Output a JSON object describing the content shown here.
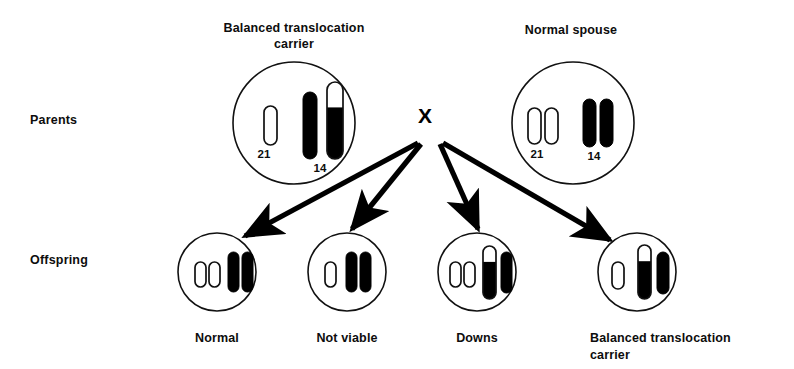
{
  "figure": {
    "row_labels": {
      "parents": "Parents",
      "offspring": "Offspring"
    },
    "cross_symbol": "X",
    "colors": {
      "outline": "#111111",
      "filled_chromosome": "#000000",
      "unfilled_chromosome": "#ffffff",
      "background": "#ffffff"
    }
  },
  "parents": [
    {
      "id": "parent-carrier",
      "caption": "Balanced translocation\ncarrier",
      "circle": {
        "cx": 294,
        "cy": 123,
        "r": 61
      },
      "chromosome_labels": [
        {
          "text": "21",
          "x": 264,
          "y": 158
        },
        {
          "text": "14",
          "x": 320,
          "y": 172
        }
      ],
      "chromosomes": [
        {
          "name": "21-unfilled",
          "x": 264,
          "top": 106,
          "width": 13,
          "height": 39,
          "fill": "none",
          "split": 0
        },
        {
          "name": "14-filled",
          "x": 303,
          "top": 92,
          "width": 14,
          "height": 67,
          "fill": "solid",
          "split": 0
        },
        {
          "name": "14-21-translocation",
          "x": 327,
          "top": 82,
          "width": 16,
          "height": 77,
          "fill": "split",
          "split": 0.33
        }
      ]
    },
    {
      "id": "parent-normal",
      "caption": "Normal spouse",
      "circle": {
        "cx": 573,
        "cy": 123,
        "r": 61
      },
      "chromosome_labels": [
        {
          "text": "21",
          "x": 537,
          "y": 158
        },
        {
          "text": "14",
          "x": 594,
          "y": 160
        }
      ],
      "chromosomes": [
        {
          "name": "21-unfilled-a",
          "x": 528,
          "top": 108,
          "width": 13,
          "height": 36,
          "fill": "none",
          "split": 0
        },
        {
          "name": "21-unfilled-b",
          "x": 545,
          "top": 108,
          "width": 13,
          "height": 36,
          "fill": "none",
          "split": 0
        },
        {
          "name": "14-filled-a",
          "x": 583,
          "top": 99,
          "width": 13,
          "height": 48,
          "fill": "solid",
          "split": 0
        },
        {
          "name": "14-filled-b",
          "x": 600,
          "top": 99,
          "width": 13,
          "height": 48,
          "fill": "solid",
          "split": 0
        }
      ]
    }
  ],
  "offspring": [
    {
      "id": "offspring-normal",
      "caption": "Normal",
      "circle": {
        "cx": 217,
        "cy": 272,
        "r": 39
      },
      "chromosomes": [
        {
          "name": "21-unfilled-a",
          "x": 195,
          "top": 262,
          "width": 11,
          "height": 25,
          "fill": "none",
          "split": 0
        },
        {
          "name": "21-unfilled-b",
          "x": 209,
          "top": 262,
          "width": 11,
          "height": 25,
          "fill": "none",
          "split": 0
        },
        {
          "name": "14-filled-a",
          "x": 228,
          "top": 252,
          "width": 11,
          "height": 40,
          "fill": "solid",
          "split": 0
        },
        {
          "name": "14-filled-b",
          "x": 242,
          "top": 252,
          "width": 11,
          "height": 40,
          "fill": "solid",
          "split": 0
        }
      ]
    },
    {
      "id": "offspring-not-viable",
      "caption": "Not  viable",
      "circle": {
        "cx": 347,
        "cy": 272,
        "r": 39
      },
      "chromosomes": [
        {
          "name": "21-unfilled-a",
          "x": 325,
          "top": 262,
          "width": 11,
          "height": 25,
          "fill": "none",
          "split": 0
        },
        {
          "name": "14-filled-a",
          "x": 346,
          "top": 252,
          "width": 11,
          "height": 40,
          "fill": "solid",
          "split": 0
        },
        {
          "name": "14-filled-b",
          "x": 360,
          "top": 252,
          "width": 11,
          "height": 40,
          "fill": "solid",
          "split": 0
        }
      ]
    },
    {
      "id": "offspring-downs",
      "caption": "Downs",
      "circle": {
        "cx": 477,
        "cy": 272,
        "r": 39
      },
      "chromosomes": [
        {
          "name": "21-unfilled-a",
          "x": 450,
          "top": 262,
          "width": 11,
          "height": 25,
          "fill": "none",
          "split": 0
        },
        {
          "name": "21-unfilled-b",
          "x": 464,
          "top": 262,
          "width": 11,
          "height": 25,
          "fill": "none",
          "split": 0
        },
        {
          "name": "14-21-translocation",
          "x": 483,
          "top": 246,
          "width": 13,
          "height": 53,
          "fill": "split",
          "split": 0.3
        },
        {
          "name": "14-filled-a",
          "x": 501,
          "top": 252,
          "width": 11,
          "height": 41,
          "fill": "solid",
          "split": 0
        }
      ]
    },
    {
      "id": "offspring-balanced-carrier",
      "caption": "Balanced  translocation\ncarrier",
      "circle": {
        "cx": 637,
        "cy": 272,
        "r": 39
      },
      "chromosomes": [
        {
          "name": "21-unfilled-a",
          "x": 612,
          "top": 262,
          "width": 12,
          "height": 27,
          "fill": "none",
          "split": 0
        },
        {
          "name": "14-21-translocation",
          "x": 638,
          "top": 245,
          "width": 13,
          "height": 54,
          "fill": "split",
          "split": 0.3
        },
        {
          "name": "14-filled-a",
          "x": 657,
          "top": 252,
          "width": 12,
          "height": 42,
          "fill": "solid",
          "split": 0
        }
      ]
    }
  ],
  "arrows": [
    {
      "name": "arrow-to-normal",
      "x1": 418,
      "y1": 143,
      "x2": 245,
      "y2": 236
    },
    {
      "name": "arrow-to-not-viable",
      "x1": 421,
      "y1": 144,
      "x2": 352,
      "y2": 229
    },
    {
      "name": "arrow-to-downs",
      "x1": 440,
      "y1": 144,
      "x2": 478,
      "y2": 229
    },
    {
      "name": "arrow-to-balanced-carrier",
      "x1": 443,
      "y1": 143,
      "x2": 610,
      "y2": 240
    }
  ]
}
